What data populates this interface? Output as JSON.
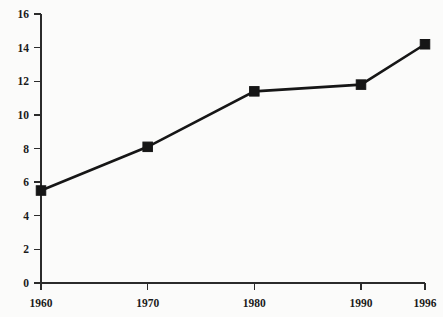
{
  "chart_data": {
    "type": "line",
    "title": "",
    "subtitle": "",
    "xlabel": "",
    "ylabel": "",
    "x": [
      1960,
      1970,
      1980,
      1990,
      1996
    ],
    "categories": [
      "1960",
      "1970",
      "1980",
      "1990",
      "1996"
    ],
    "values": [
      5.5,
      8.1,
      11.4,
      11.8,
      14.2
    ],
    "series": [
      {
        "name": "",
        "values": [
          5.5,
          8.1,
          11.4,
          11.8,
          14.2
        ]
      }
    ],
    "xlim": [
      1960,
      1996
    ],
    "ylim": [
      0,
      16
    ],
    "xticks": [
      "1960",
      "1970",
      "1980",
      "1990",
      "1996"
    ],
    "yticks": [
      "0",
      "2",
      "4",
      "6",
      "8",
      "10",
      "12",
      "14",
      "16"
    ],
    "grid": false,
    "legend": false,
    "legend_position": "none",
    "marker": "square",
    "line_color": "#161616",
    "marker_color": "#161616",
    "axis_color": "#2b2b2b",
    "background_color": "#fbfbfa",
    "annotations": []
  },
  "axes": {
    "y_tick_labels": [
      {
        "value": 0,
        "label": "0"
      },
      {
        "value": 2,
        "label": "2"
      },
      {
        "value": 4,
        "label": "4"
      },
      {
        "value": 6,
        "label": "6"
      },
      {
        "value": 8,
        "label": "8"
      },
      {
        "value": 10,
        "label": "10"
      },
      {
        "value": 12,
        "label": "12"
      },
      {
        "value": 14,
        "label": "14"
      },
      {
        "value": 16,
        "label": "16"
      }
    ],
    "x_tick_labels": [
      {
        "value": 1960,
        "label": "1960"
      },
      {
        "value": 1970,
        "label": "1970"
      },
      {
        "value": 1980,
        "label": "1980"
      },
      {
        "value": 1990,
        "label": "1990"
      },
      {
        "value": 1996,
        "label": "1996"
      }
    ]
  }
}
